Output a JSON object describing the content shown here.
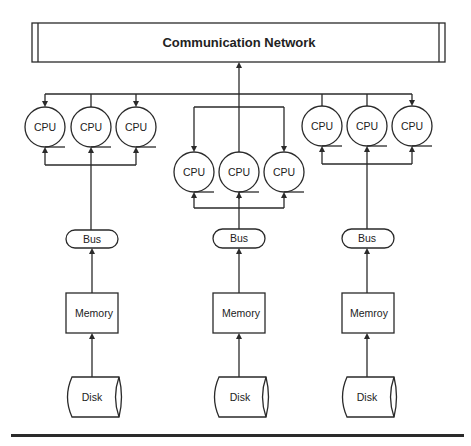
{
  "network": {
    "label": "Communication Network"
  },
  "colors": {
    "line": "#2a2a2a",
    "background": "#ffffff",
    "text": "#222222"
  },
  "clusters": [
    {
      "id": "left",
      "cpus": [
        {
          "label": "CPU"
        },
        {
          "label": "CPU"
        },
        {
          "label": "CPU"
        }
      ],
      "bus": {
        "label": "Bus"
      },
      "memory": {
        "label": "Memory"
      },
      "disk": {
        "label": "Disk"
      }
    },
    {
      "id": "middle",
      "cpus": [
        {
          "label": "CPU"
        },
        {
          "label": "CPU"
        },
        {
          "label": "CPU"
        }
      ],
      "bus": {
        "label": "Bus"
      },
      "memory": {
        "label": "Memory"
      },
      "disk": {
        "label": "Disk"
      }
    },
    {
      "id": "right",
      "cpus": [
        {
          "label": "CPU"
        },
        {
          "label": "CPU"
        },
        {
          "label": "CPU"
        }
      ],
      "bus": {
        "label": "Bus"
      },
      "memory": {
        "label": "Memroy"
      },
      "disk": {
        "label": "Disk"
      }
    }
  ]
}
